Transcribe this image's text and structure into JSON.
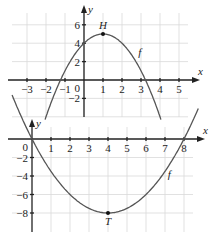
{
  "chart_data": [
    {
      "type": "line",
      "title": "",
      "xlabel": "x",
      "ylabel": "y",
      "function_label": "f",
      "formula": "f(x) = -(x-1)^2 + 5",
      "xlim": [
        -3.8,
        5.8
      ],
      "ylim": [
        -3.8,
        7.5
      ],
      "x_ticks": [
        -3,
        -2,
        -1,
        1,
        2,
        3,
        4,
        5
      ],
      "y_ticks": [
        -2,
        2,
        4,
        6
      ],
      "origin_label": "0",
      "grid": true,
      "points": [
        {
          "name": "H",
          "x": 1,
          "y": 5
        }
      ],
      "x": [
        -2,
        -1.24,
        0,
        1,
        2,
        3.24,
        4
      ],
      "values": [
        -4,
        0,
        4,
        5,
        4,
        0,
        -4
      ]
    },
    {
      "type": "line",
      "title": "",
      "xlabel": "x",
      "ylabel": "y",
      "function_label": "f",
      "formula": "f(x) = 0.5(x-4)^2 - 8",
      "xlim": [
        -1,
        9
      ],
      "ylim": [
        -10,
        1.5
      ],
      "x_ticks": [
        1,
        2,
        3,
        4,
        5,
        6,
        7,
        8
      ],
      "y_ticks": [
        -2,
        -4,
        -6,
        -8
      ],
      "origin_label": "0",
      "grid": true,
      "points": [
        {
          "name": "T",
          "x": 4,
          "y": -8
        }
      ],
      "x": [
        0,
        2,
        4,
        6,
        8
      ],
      "values": [
        0,
        -6,
        -8,
        -6,
        0
      ]
    }
  ]
}
